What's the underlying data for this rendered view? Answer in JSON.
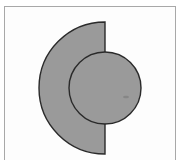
{
  "diagram": {
    "type": "geometric-shapes",
    "colors": {
      "fill": "#9a9a9a",
      "stroke": "#2a2a2a",
      "frame": "#a8a8a8",
      "background": "#ffffff"
    },
    "shapes": [
      {
        "name": "left-half-disc",
        "kind": "semicircle",
        "center": [
          105,
          88
        ],
        "radius": 66,
        "orientation": "left"
      },
      {
        "name": "circle",
        "kind": "circle",
        "center": [
          105,
          88
        ],
        "radius": 36
      }
    ]
  }
}
